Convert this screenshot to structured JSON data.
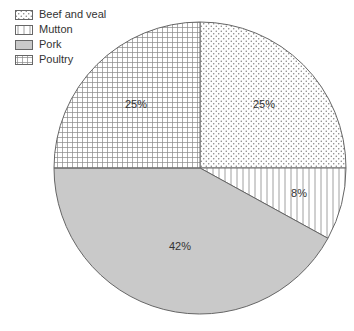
{
  "chart_data": {
    "type": "pie",
    "title": "",
    "categories": [
      "Beef and veal",
      "Mutton",
      "Pork",
      "Poultry"
    ],
    "values": [
      25,
      8,
      42,
      25
    ],
    "labels": [
      "25%",
      "8%",
      "42%",
      "25%"
    ],
    "patterns": [
      "dots",
      "vertical-stripes",
      "solid-gray",
      "grid"
    ],
    "start_angle_deg": 90,
    "direction": "clockwise",
    "legend_position": "top-left"
  },
  "legend": {
    "items": [
      {
        "label": "Beef and veal",
        "pattern": "dots"
      },
      {
        "label": "Mutton",
        "pattern": "vertical-stripes"
      },
      {
        "label": "Pork",
        "pattern": "solid-gray"
      },
      {
        "label": "Poultry",
        "pattern": "grid"
      }
    ]
  },
  "colors": {
    "outline": "#666666",
    "pattern_ink": "#777777",
    "pork_fill": "#c9c9c9",
    "text": "#333333"
  }
}
